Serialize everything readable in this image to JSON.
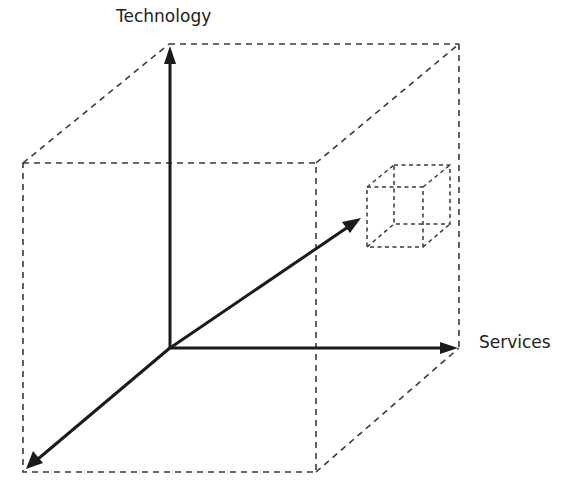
{
  "diagram": {
    "type": "3d-axis-cube",
    "axes": [
      {
        "name": "Technology",
        "direction": "up",
        "label": "Technology"
      },
      {
        "name": "Services",
        "direction": "right",
        "label": "Services"
      },
      {
        "name": "unlabeled-depth-axis",
        "direction": "diagonal",
        "label": ""
      }
    ],
    "elements": [
      {
        "id": "large-cube",
        "style": "dashed-wireframe"
      },
      {
        "id": "small-cube",
        "style": "dashed-wireframe",
        "position": "upper-right, where the diagonal axis points"
      }
    ],
    "colors": {
      "line": "#1a1a1a",
      "dashed": "#3a3a3a",
      "background": "#ffffff"
    }
  },
  "labels": {
    "technology": "Technology",
    "services": "Services"
  }
}
